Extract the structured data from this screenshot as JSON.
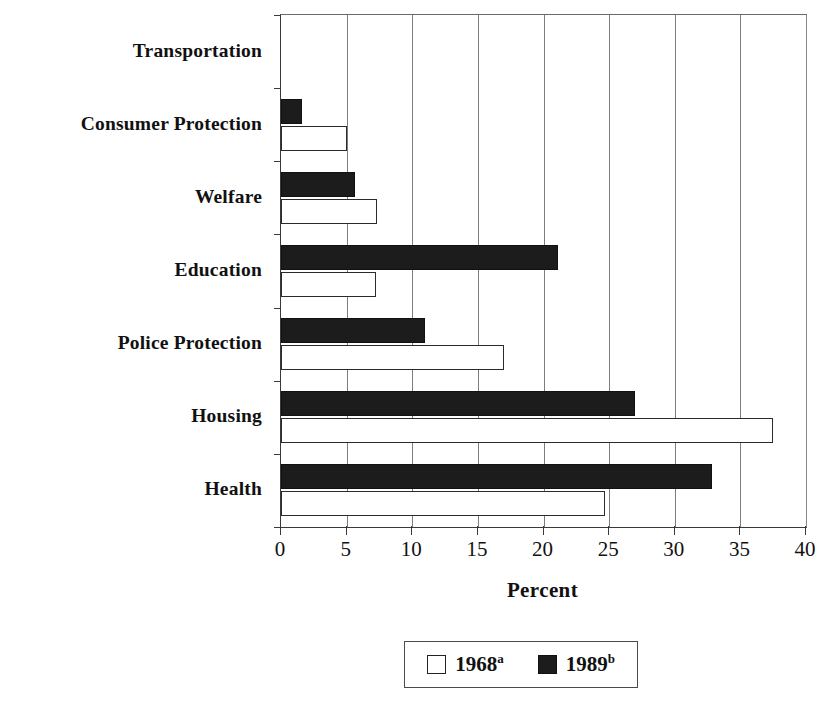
{
  "chart_data": {
    "type": "bar",
    "orientation": "horizontal",
    "title": "",
    "xlabel": "Percent",
    "ylabel": "",
    "xlim": [
      0,
      40
    ],
    "xticks": [
      0,
      5,
      10,
      15,
      20,
      25,
      30,
      35,
      40
    ],
    "xtick_labels": [
      "0",
      "5",
      "10",
      "15",
      "20",
      "25",
      "30",
      "35",
      "40"
    ],
    "grid": "vertical",
    "legend_position": "bottom-center",
    "categories": [
      "Transportation",
      "Consumer Protection",
      "Welfare",
      "Education",
      "Police Protection",
      "Housing",
      "Health"
    ],
    "series": [
      {
        "name": "1968",
        "name_superscript": "a",
        "style": "open",
        "color": "#ffffff",
        "edge_color": "#2b2b2b",
        "values": [
          0,
          5.0,
          7.3,
          7.2,
          17.0,
          37.5,
          24.7
        ]
      },
      {
        "name": "1989",
        "name_superscript": "b",
        "style": "filled",
        "color": "#1c1c1c",
        "edge_color": "#111111",
        "values": [
          0,
          1.6,
          5.6,
          21.1,
          11.0,
          27.0,
          32.8
        ]
      }
    ]
  },
  "legend": {
    "entries": [
      {
        "label": "1968",
        "superscript": "a",
        "swatch": "open-square"
      },
      {
        "label": "1989",
        "superscript": "b",
        "swatch": "filled-square"
      }
    ]
  },
  "axis": {
    "x_title": "Percent"
  }
}
